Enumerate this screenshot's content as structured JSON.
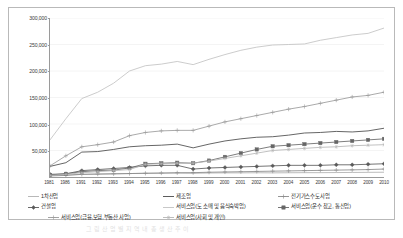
{
  "chart_data": {
    "type": "line",
    "title": "",
    "xlabel": "",
    "ylabel": "",
    "ylim": [
      0,
      300000
    ],
    "ytick_labels": [
      "300,000",
      "250,000",
      "200,000",
      "150,000",
      "100,000",
      "50,000"
    ],
    "ytick_values": [
      300000,
      250000,
      200000,
      150000,
      100000,
      50000
    ],
    "grid": true,
    "legend_position": "bottom",
    "x": [
      1981,
      1986,
      1991,
      1992,
      1993,
      1994,
      1995,
      1996,
      1997,
      1998,
      1999,
      2000,
      2001,
      2002,
      2003,
      2004,
      2005,
      2006,
      2007,
      2008,
      2009,
      2010
    ],
    "categories": [
      "1981",
      "1986",
      "1991",
      "1992",
      "1993",
      "1994",
      "1995",
      "1996",
      "1997",
      "1998",
      "1999",
      "2000",
      "2001",
      "2002",
      "2003",
      "2004",
      "2005",
      "2006",
      "2007",
      "2008",
      "2009",
      "2010"
    ],
    "series": [
      {
        "name": "1차산업",
        "marker": "none",
        "color": "#b0b0b0",
        "values": [
          3000,
          4000,
          5000,
          5500,
          6000,
          6500,
          7000,
          7200,
          7500,
          7000,
          7500,
          7800,
          7800,
          8000,
          7800,
          8000,
          8200,
          8200,
          8400,
          8600,
          8800,
          9000
        ]
      },
      {
        "name": "제조업",
        "marker": "none",
        "color": "#4a4a4a",
        "values": [
          20000,
          27000,
          47000,
          48000,
          52000,
          57000,
          59000,
          60000,
          62000,
          55000,
          62000,
          68000,
          72000,
          75000,
          76000,
          79000,
          83000,
          84000,
          86000,
          85000,
          87000,
          92000
        ]
      },
      {
        "name": "전기가스수도사업",
        "marker": "plus",
        "color": "#8a8a8a",
        "values": [
          2000,
          3000,
          5000,
          5500,
          6000,
          6500,
          7000,
          7500,
          8000,
          8200,
          9000,
          9500,
          10000,
          10500,
          11000,
          11500,
          12000,
          12500,
          13000,
          13500,
          14000,
          15000
        ]
      },
      {
        "name": "건설업",
        "marker": "diamond",
        "color": "#5a5a5a",
        "values": [
          5000,
          6000,
          12000,
          14000,
          16000,
          18000,
          21000,
          22000,
          22000,
          15000,
          17000,
          18000,
          19000,
          20000,
          21000,
          22000,
          22000,
          22000,
          23000,
          23000,
          24000,
          25000
        ]
      },
      {
        "name": "서비스업(도 소매 및 음식숙박업)",
        "marker": "none",
        "color": "#c2c2c2",
        "values": [
          70000,
          110000,
          148000,
          160000,
          177000,
          200000,
          210000,
          213000,
          218000,
          212000,
          222000,
          231000,
          239000,
          245000,
          249000,
          250000,
          251000,
          258000,
          263000,
          268000,
          271000,
          281000
        ]
      },
      {
        "name": "서비스업(운수 창고, 통신업)",
        "marker": "square",
        "color": "#666666",
        "values": [
          4000,
          6000,
          10000,
          12000,
          13000,
          17000,
          25000,
          26000,
          27000,
          26000,
          31000,
          38000,
          45000,
          52000,
          58000,
          60000,
          62000,
          64000,
          66000,
          68000,
          70000,
          72000
        ]
      },
      {
        "name": "서비스업(금융,보험,부동산 사업)",
        "marker": "plus",
        "color": "#9a9a9a",
        "values": [
          21000,
          40000,
          57000,
          61000,
          66000,
          78000,
          84000,
          87000,
          88000,
          88000,
          96000,
          104000,
          110000,
          116000,
          122000,
          128000,
          133000,
          139000,
          145000,
          151000,
          154000,
          160000
        ]
      },
      {
        "name": "서비스업(사회 및 개인)",
        "marker": "asterisk",
        "color": "#b5b5b5",
        "values": [
          3000,
          5000,
          8000,
          10000,
          12000,
          14000,
          24000,
          25000,
          26000,
          26000,
          30000,
          35000,
          40000,
          45000,
          50000,
          52000,
          54000,
          56000,
          57000,
          59000,
          60000,
          61000
        ]
      }
    ]
  },
  "legend": {
    "rows": [
      [
        {
          "label": "1차산업",
          "key": "line",
          "color": "#b0b0b0",
          "left": 5
        },
        {
          "label": "제조업",
          "key": "line",
          "color": "#4a4a4a",
          "left": 140
        },
        {
          "label": "전기가스수도사업",
          "key": "plus",
          "color": "#8a8a8a",
          "left": 255
        }
      ],
      [
        {
          "label": "건설업",
          "key": "diamond",
          "color": "#5a5a5a",
          "left": 5
        },
        {
          "label": "서비스업(도 소매 및 음식숙박업)",
          "key": "line",
          "color": "#c2c2c2",
          "left": 140
        },
        {
          "label": "서비스업(운수 창고, 통신업)",
          "key": "square",
          "color": "#666666",
          "left": 255
        }
      ],
      [
        {
          "label": "서비스업(금융,보험,부동산 사업)",
          "key": "plus",
          "color": "#9a9a9a",
          "left": 25
        },
        {
          "label": "서비스업(사회 및 개인)",
          "key": "asterisk",
          "color": "#b5b5b5",
          "left": 140
        }
      ]
    ]
  },
  "caption": {
    "text": "그 림 산 업 별 지 역 내 총 생 산 추 이"
  }
}
